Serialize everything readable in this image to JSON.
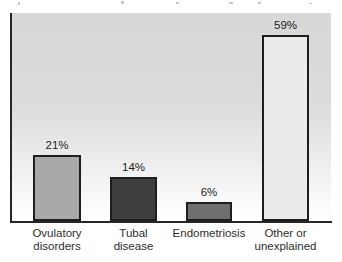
{
  "chart_data": {
    "type": "bar",
    "categories": [
      "Ovulatory\ndisorders",
      "Tubal\ndisease",
      "Endometriosis",
      "Other or\nunexplained"
    ],
    "values": [
      21,
      14,
      6,
      59
    ],
    "value_labels": [
      "21%",
      "14%",
      "6%",
      "59%"
    ],
    "title": "",
    "xlabel": "",
    "ylabel": "",
    "ylim": [
      0,
      66
    ],
    "grid": false,
    "legend": false,
    "bar_colors": [
      "#a9a9a9",
      "#3e3e3e",
      "#6f6f6f",
      "#ebebeb"
    ],
    "bar_border_color": "#1e1e1e",
    "axis_color": "#262626",
    "plot_bg_top": "#d8d8d8",
    "plot_bg_mid": "#dcdcdc",
    "plot_bg_bottom": "#fdfdfd",
    "value_label_color": "#1c1c1c",
    "category_label_color": "#2d2d2d"
  }
}
